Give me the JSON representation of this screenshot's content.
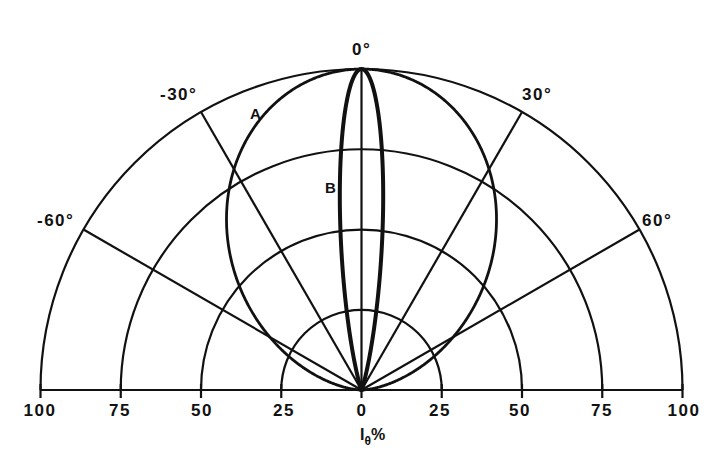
{
  "chart_data": {
    "type": "polar",
    "title": "",
    "half_plane": "upper",
    "angle_range_deg": [
      -90,
      90
    ],
    "angle_labels": [
      {
        "deg": -60,
        "label": "-60°"
      },
      {
        "deg": -30,
        "label": "-30°"
      },
      {
        "deg": 0,
        "label": "0°"
      },
      {
        "deg": 30,
        "label": "30°"
      },
      {
        "deg": 60,
        "label": "60°"
      }
    ],
    "radial_axis": {
      "label_main": "I",
      "label_sub": "θ",
      "label_unit": "%",
      "rings": [
        25,
        50,
        75,
        100
      ],
      "tick_labels_left": [
        "100",
        "75",
        "50",
        "25",
        "0"
      ],
      "tick_labels_right": [
        "25",
        "50",
        "75",
        "100"
      ],
      "range": [
        0,
        100
      ]
    },
    "grid": true,
    "series": [
      {
        "name": "A",
        "description": "broad lobe, approx cos^1.6(θ)",
        "exponent": 1.6,
        "points": [
          {
            "deg": 0,
            "r": 100
          },
          {
            "deg": 10,
            "r": 97.6
          },
          {
            "deg": 20,
            "r": 90.5
          },
          {
            "deg": 30,
            "r": 79.4
          },
          {
            "deg": 40,
            "r": 65.2
          },
          {
            "deg": 50,
            "r": 49.3
          },
          {
            "deg": 60,
            "r": 33.0
          },
          {
            "deg": 70,
            "r": 18.0
          },
          {
            "deg": 80,
            "r": 6.1
          },
          {
            "deg": 90,
            "r": 0
          }
        ]
      },
      {
        "name": "B",
        "description": "narrow lobe, approx cos^80(θ)",
        "exponent": 80,
        "points": [
          {
            "deg": 0,
            "r": 100
          },
          {
            "deg": 2,
            "r": 95.2
          },
          {
            "deg": 4,
            "r": 82.3
          },
          {
            "deg": 6,
            "r": 64.5
          },
          {
            "deg": 8,
            "r": 45.7
          },
          {
            "deg": 10,
            "r": 29.6
          },
          {
            "deg": 14,
            "r": 9.2
          },
          {
            "deg": 20,
            "r": 0.7
          },
          {
            "deg": 90,
            "r": 0
          }
        ]
      }
    ],
    "curve_labels": [
      {
        "name": "A",
        "text": "A"
      },
      {
        "name": "B",
        "text": "B"
      }
    ]
  }
}
